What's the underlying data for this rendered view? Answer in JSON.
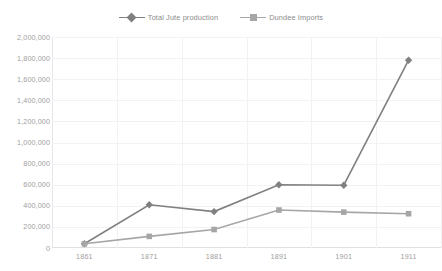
{
  "chart_data": {
    "type": "line",
    "title": "",
    "subtitle": "",
    "xlabel": "",
    "ylabel": "",
    "categories": [
      "1861",
      "1871",
      "1881",
      "1891",
      "1901",
      "1911"
    ],
    "series": [
      {
        "name": "Total Jute production",
        "values": [
          40000,
          410000,
          345000,
          600000,
          595000,
          1780000
        ],
        "color": "#808080",
        "marker": "diamond"
      },
      {
        "name": "Dundee Imports",
        "values": [
          40000,
          110000,
          175000,
          360000,
          340000,
          325000
        ],
        "color": "#a6a6a6",
        "marker": "square"
      }
    ],
    "ylim": [
      0,
      2000000
    ],
    "ytick_step": 200000,
    "yticks": [
      "2,000,000",
      "1,800,000",
      "1,600,000",
      "1,400,000",
      "1,200,000",
      "1,000,000",
      "800,000",
      "600,000",
      "400,000",
      "200,000",
      "0"
    ],
    "grid": {
      "horizontal": true,
      "vertical": true
    },
    "legend": {
      "position": "top",
      "entries": [
        "Total Jute production",
        "Dundee Imports"
      ]
    },
    "colors": {
      "gridline": "#f2f2f2",
      "axis": "#e0e0e0",
      "tick_text": "#9e9e9e",
      "legend_text": "#8c8c8c",
      "background": "#ffffff"
    }
  }
}
